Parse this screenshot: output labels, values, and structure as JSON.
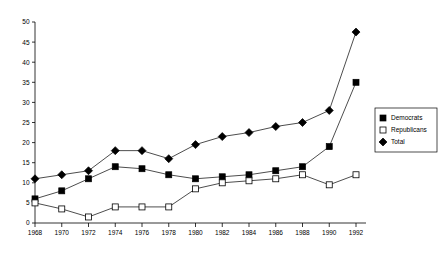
{
  "chart_data": {
    "type": "line",
    "title": "",
    "subtitle": "",
    "xlabel": "",
    "ylabel": "",
    "x": [
      1968,
      1970,
      1972,
      1974,
      1976,
      1978,
      1980,
      1982,
      1984,
      1986,
      1988,
      1990,
      1992
    ],
    "categories": [
      "1968",
      "1970",
      "1972",
      "1974",
      "1976",
      "1978",
      "1980",
      "1982",
      "1984",
      "1986",
      "1988",
      "1990",
      "1992"
    ],
    "series": [
      {
        "name": "Democrats",
        "marker": "filled-square",
        "values": [
          6,
          8,
          11,
          14,
          13.5,
          12,
          11,
          11.5,
          12,
          13,
          14,
          19,
          35
        ]
      },
      {
        "name": "Republicans",
        "marker": "open-square",
        "values": [
          5,
          3.5,
          1.5,
          4,
          4,
          4,
          8.5,
          10,
          10.5,
          11,
          12,
          9.5,
          12
        ]
      },
      {
        "name": "Total",
        "marker": "filled-diamond",
        "values": [
          11,
          12,
          13,
          18,
          18,
          16,
          19.5,
          21.5,
          22.5,
          24,
          25,
          28,
          47.5
        ]
      }
    ],
    "xlim": [
      1968,
      1992
    ],
    "ylim": [
      0,
      50
    ],
    "yticks": [
      0,
      5,
      10,
      15,
      20,
      25,
      30,
      35,
      40,
      45,
      50
    ],
    "ytick_labels": [
      "0",
      "5",
      "10",
      "15",
      "20",
      "25",
      "30",
      "35",
      "40",
      "45",
      "50"
    ],
    "xtick_labels": [
      "1968",
      "1970",
      "1972",
      "1974",
      "1976",
      "1978",
      "1980",
      "1982",
      "1984",
      "1986",
      "1988",
      "1990",
      "1992"
    ],
    "grid": false,
    "legend_position": "right",
    "legend_entries": [
      "Democrats",
      "Republicans",
      "Total"
    ],
    "colors": {
      "axis": "#000000",
      "line": "#000000",
      "marker_fill": "#000000",
      "marker_open": "#ffffff",
      "background": "#ffffff"
    }
  }
}
